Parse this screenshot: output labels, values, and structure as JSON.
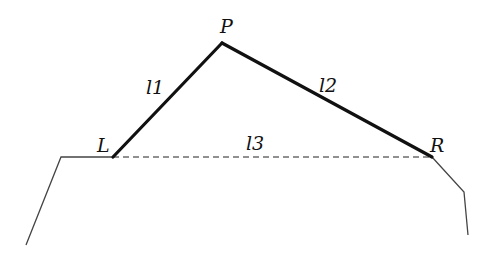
{
  "diagram": {
    "points": {
      "P": {
        "label": "P",
        "x": 222,
        "y": 43
      },
      "L": {
        "label": "L",
        "x": 113,
        "y": 157
      },
      "R": {
        "label": "R",
        "x": 432,
        "y": 157
      }
    },
    "segments": [
      {
        "id": "l1",
        "label": "l1",
        "from": "L",
        "to": "P",
        "style": "bold"
      },
      {
        "id": "l2",
        "label": "l2",
        "from": "P",
        "to": "R",
        "style": "bold"
      },
      {
        "id": "l3",
        "label": "l3",
        "from": "L",
        "to": "R",
        "style": "dashed"
      }
    ],
    "ground_profile": {
      "left": [
        [
          26,
          245
        ],
        [
          61,
          157
        ],
        [
          113,
          157
        ]
      ],
      "right": [
        [
          432,
          157
        ],
        [
          464,
          192
        ],
        [
          468,
          235
        ]
      ]
    },
    "labels": {
      "P": "P",
      "L": "L",
      "R": "R",
      "l1": "l1",
      "l2": "l2",
      "l3": "l3"
    },
    "colors": {
      "line": "#111111",
      "thin_line": "#444444",
      "background": "#ffffff"
    }
  }
}
